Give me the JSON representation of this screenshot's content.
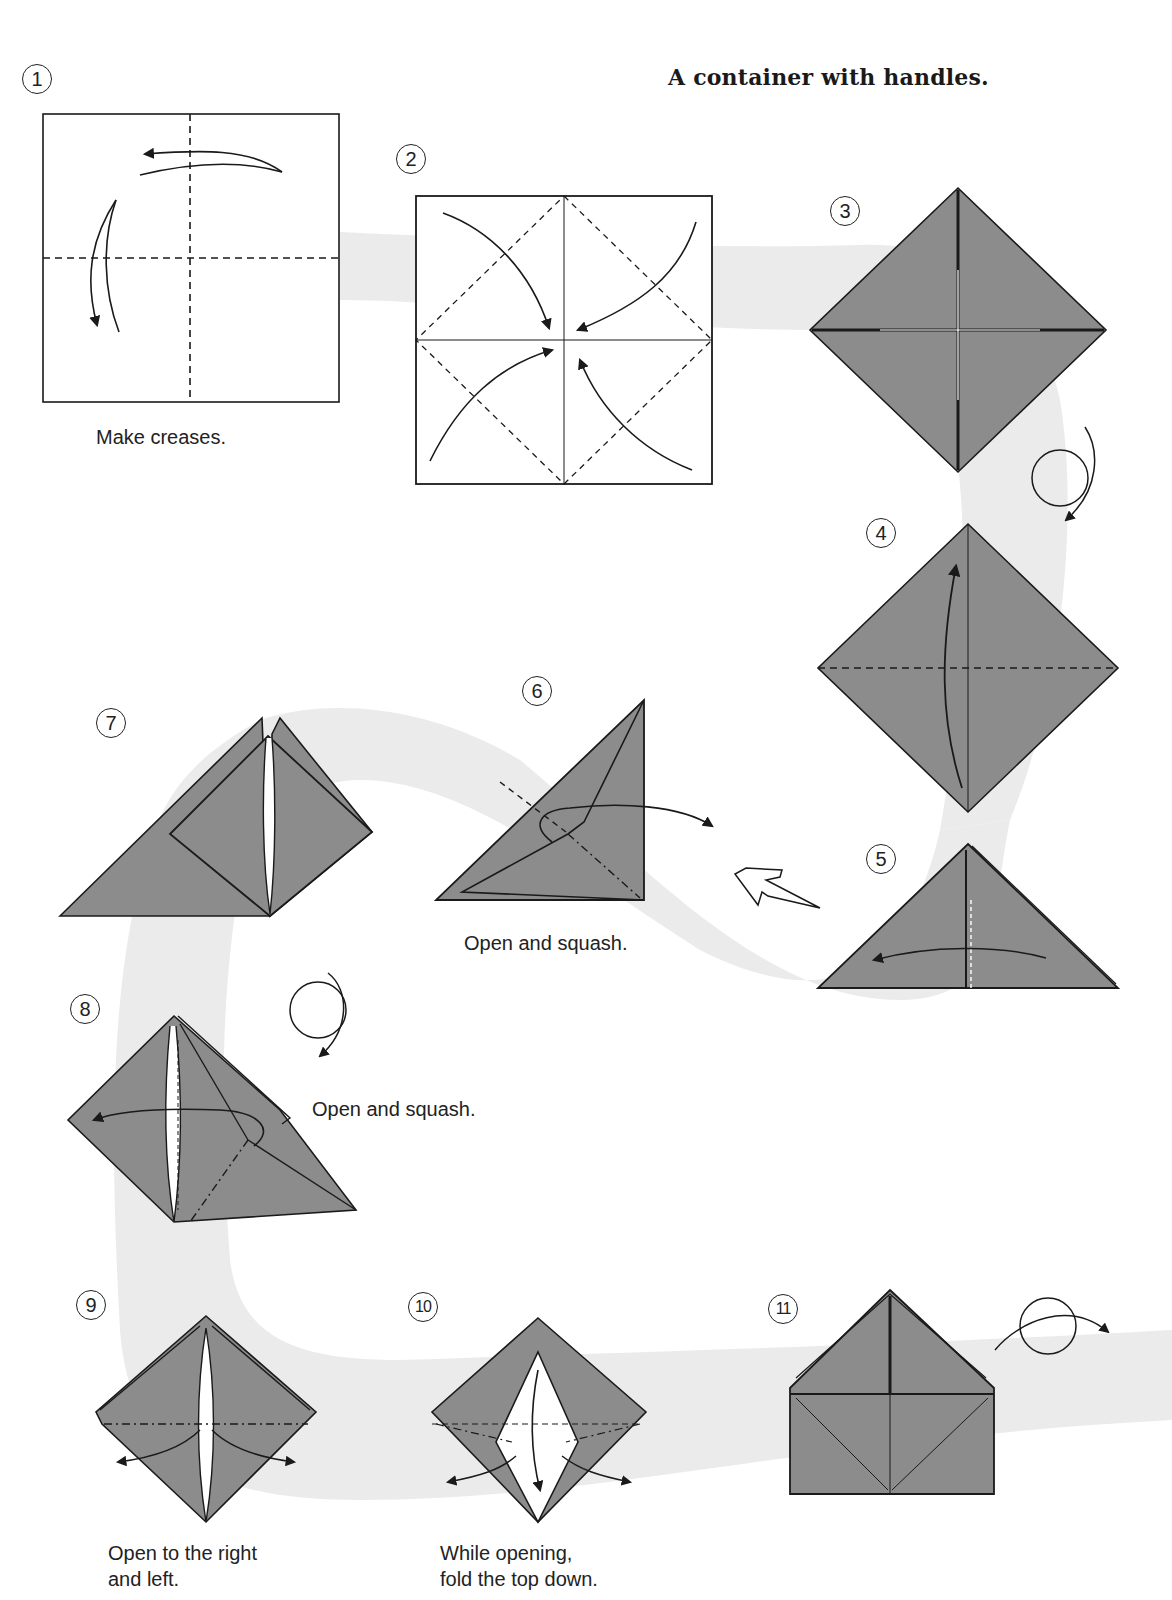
{
  "page": {
    "title": "A container with handles.",
    "colors": {
      "paper_fill": "#8c8c8c",
      "path_background": "#ebebeb",
      "line": "#1a1a1a",
      "page": "#ffffff"
    }
  },
  "steps": [
    {
      "number": "1",
      "caption": "Make creases.",
      "diagram": "square-with-dashed-valley-creases-and-fold-arrows"
    },
    {
      "number": "2",
      "caption": "",
      "diagram": "square-fold-four-corners-to-center"
    },
    {
      "number": "3",
      "caption": "",
      "diagram": "colored-diamond-blintz"
    },
    {
      "number": "4",
      "caption": "",
      "diagram": "diamond-fold-bottom-up-along-dashed-line"
    },
    {
      "number": "5",
      "caption": "",
      "diagram": "triangle-fold-right-to-left"
    },
    {
      "number": "6",
      "caption": "Open and squash.",
      "diagram": "triangle-squash-fold"
    },
    {
      "number": "7",
      "caption": "",
      "diagram": "squashed-flap-result"
    },
    {
      "number": "8",
      "caption": "Open and squash.",
      "diagram": "turn-over-and-squash"
    },
    {
      "number": "9",
      "caption_lines": [
        "Open to the right",
        "and left."
      ],
      "diagram": "open-right-and-left"
    },
    {
      "number": "10",
      "caption_lines": [
        "While opening,",
        "fold the top down."
      ],
      "diagram": "open-and-fold-top-down"
    },
    {
      "number": "11",
      "caption": "",
      "diagram": "container-with-handles-turn-over"
    }
  ],
  "symbols": {
    "turn_over_icon": "turn-over-loop-arrow",
    "repeat_arrow_icon": "hollow-push-arrow"
  }
}
